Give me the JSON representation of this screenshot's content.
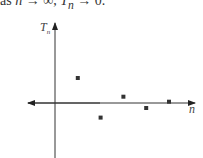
{
  "caption": {
    "prefix": "as ",
    "var_n": "n",
    "arrow1": " → ∞, ",
    "var_T": "T",
    "sub_n": "n",
    "arrow2": " → 0."
  },
  "chart_data": {
    "type": "scatter",
    "title": "",
    "xlabel": "n",
    "ylabel": "T_n",
    "x": [
      1,
      2,
      3,
      4,
      5
    ],
    "values": [
      0.6,
      -0.35,
      0.15,
      -0.12,
      0.03
    ],
    "grid": false,
    "legend": null
  },
  "axes": {
    "y_label": "T",
    "y_label_sub": "n",
    "x_label": "n"
  }
}
